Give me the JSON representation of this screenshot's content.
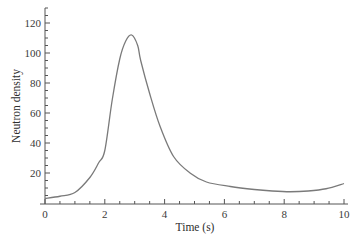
{
  "chart_data": {
    "type": "line",
    "title": "",
    "xlabel": "Time (s)",
    "ylabel": "Neutron density",
    "xlim": [
      0,
      10
    ],
    "ylim": [
      0,
      130
    ],
    "grid": false,
    "legend": null,
    "x_ticks": [
      0,
      2,
      4,
      6,
      8,
      10
    ],
    "x_tick_labels": [
      "0",
      "2",
      "4",
      "6",
      "8",
      "10"
    ],
    "x_minor_step": 0.5,
    "y_ticks": [
      20,
      40,
      60,
      80,
      100,
      120
    ],
    "y_tick_labels": [
      "20",
      "40",
      "60",
      "80",
      "100",
      "120"
    ],
    "y_minor_step": 5,
    "series": [
      {
        "name": "Neutron density",
        "color": "#7a7a7a",
        "x": [
          0,
          0.5,
          1.0,
          1.5,
          1.8,
          2.0,
          2.25,
          2.5,
          2.7,
          2.9,
          3.1,
          3.2,
          3.5,
          3.85,
          4.3,
          4.85,
          5.4,
          6.2,
          7.0,
          7.6,
          8.2,
          8.8,
          9.4,
          10.0
        ],
        "values": [
          3,
          4.5,
          7,
          17,
          27,
          35,
          69,
          96,
          108,
          112,
          105,
          95,
          73,
          51,
          31,
          20,
          14,
          11,
          9,
          8,
          7.5,
          8,
          9.5,
          13
        ]
      }
    ]
  }
}
